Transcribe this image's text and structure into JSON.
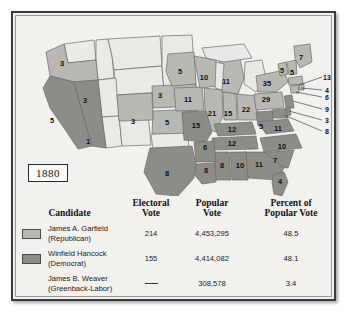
{
  "figure": {
    "year_label": "1880",
    "colors": {
      "republican": "#b9b9b4",
      "democrat": "#8d8d87",
      "territory": "#eceae4",
      "lake": "#e8e9e6",
      "outline": "#6b6b66",
      "frame": "#3a3a3a",
      "background": "#f2f1ee"
    }
  },
  "map": {
    "states": [
      {
        "abbr": "OR",
        "votes": "3",
        "party": "republican",
        "x": 46,
        "y": 48
      },
      {
        "abbr": "NV",
        "votes": "3",
        "party": "democrat",
        "x": 69,
        "y": 85
      },
      {
        "abbr": "CA",
        "votes": "5",
        "party": "democrat",
        "x": 36,
        "y": 105
      },
      {
        "abbr": "CA-1",
        "votes": "1",
        "party": "republican",
        "x": 72,
        "y": 126
      },
      {
        "abbr": "CO",
        "votes": "3",
        "party": "republican",
        "x": 117,
        "y": 106
      },
      {
        "abbr": "NE",
        "votes": "3",
        "party": "republican",
        "x": 144,
        "y": 80
      },
      {
        "abbr": "KS",
        "votes": "5",
        "party": "republican",
        "x": 151,
        "y": 107
      },
      {
        "abbr": "MN",
        "votes": "5",
        "party": "republican",
        "x": 164,
        "y": 56
      },
      {
        "abbr": "IA",
        "votes": "11",
        "party": "republican",
        "x": 172,
        "y": 84
      },
      {
        "abbr": "MO",
        "votes": "15",
        "party": "democrat",
        "x": 180,
        "y": 110
      },
      {
        "abbr": "WI",
        "votes": "10",
        "party": "republican",
        "x": 188,
        "y": 62
      },
      {
        "abbr": "IL",
        "votes": "21",
        "party": "republican",
        "x": 196,
        "y": 98
      },
      {
        "abbr": "MI",
        "votes": "11",
        "party": "republican",
        "x": 210,
        "y": 66
      },
      {
        "abbr": "IN",
        "votes": "15",
        "party": "republican",
        "x": 212,
        "y": 98
      },
      {
        "abbr": "OH",
        "votes": "22",
        "party": "republican",
        "x": 230,
        "y": 94
      },
      {
        "abbr": "KY",
        "votes": "12",
        "party": "democrat",
        "x": 216,
        "y": 114
      },
      {
        "abbr": "TN",
        "votes": "12",
        "party": "democrat",
        "x": 216,
        "y": 128
      },
      {
        "abbr": "WV",
        "votes": "5",
        "party": "democrat",
        "x": 245,
        "y": 111
      },
      {
        "abbr": "VA",
        "votes": "11",
        "party": "democrat",
        "x": 262,
        "y": 113
      },
      {
        "abbr": "NC",
        "votes": "10",
        "party": "democrat",
        "x": 266,
        "y": 131
      },
      {
        "abbr": "SC",
        "votes": "7",
        "party": "democrat",
        "x": 259,
        "y": 145
      },
      {
        "abbr": "GA",
        "votes": "11",
        "party": "democrat",
        "x": 243,
        "y": 149
      },
      {
        "abbr": "AL",
        "votes": "10",
        "party": "democrat",
        "x": 224,
        "y": 150
      },
      {
        "abbr": "MS",
        "votes": "8",
        "party": "democrat",
        "x": 206,
        "y": 150
      },
      {
        "abbr": "AR",
        "votes": "6",
        "party": "democrat",
        "x": 189,
        "y": 132
      },
      {
        "abbr": "LA",
        "votes": "8",
        "party": "democrat",
        "x": 190,
        "y": 155
      },
      {
        "abbr": "TX",
        "votes": "8",
        "party": "democrat",
        "x": 151,
        "y": 158
      },
      {
        "abbr": "FL",
        "votes": "4",
        "party": "democrat",
        "x": 264,
        "y": 166
      },
      {
        "abbr": "PA",
        "votes": "29",
        "party": "republican",
        "x": 250,
        "y": 84
      },
      {
        "abbr": "NY",
        "votes": "35",
        "party": "republican",
        "x": 251,
        "y": 68
      },
      {
        "abbr": "VT",
        "votes": "5",
        "party": "republican",
        "x": 266,
        "y": 55
      },
      {
        "abbr": "NH",
        "votes": "5",
        "party": "republican",
        "x": 276,
        "y": 57
      },
      {
        "abbr": "ME",
        "votes": "7",
        "party": "republican",
        "x": 285,
        "y": 42
      }
    ],
    "callouts": [
      {
        "abbr": "MA",
        "votes": "13",
        "party": "republican",
        "lx": 311,
        "ly": 61,
        "ax": 283,
        "ay": 69
      },
      {
        "abbr": "RI",
        "votes": "4",
        "party": "republican",
        "lx": 311,
        "ly": 74,
        "ax": 283,
        "ay": 73
      },
      {
        "abbr": "CT",
        "votes": "6",
        "party": "republican",
        "lx": 311,
        "ly": 81,
        "ax": 280,
        "ay": 77
      },
      {
        "abbr": "NJ",
        "votes": "9",
        "party": "democrat",
        "lx": 311,
        "ly": 93,
        "ax": 276,
        "ay": 85
      },
      {
        "abbr": "DE",
        "votes": "3",
        "party": "democrat",
        "lx": 311,
        "ly": 104,
        "ax": 272,
        "ay": 93
      },
      {
        "abbr": "MD",
        "votes": "8",
        "party": "democrat",
        "lx": 311,
        "ly": 115,
        "ax": 270,
        "ay": 97
      }
    ]
  },
  "table": {
    "headers": {
      "candidate": "Candidate",
      "electoral_line1": "Electoral",
      "electoral_line2": "Vote",
      "popular_line1": "Popular",
      "popular_line2": "Vote",
      "percent_line1": "Percent of",
      "percent_line2": "Popular Vote"
    },
    "rows": [
      {
        "name": "James A. Garfield",
        "party": "(Republican)",
        "electoral_vote": "214",
        "popular_vote": "4,453,295",
        "percent": "48.5",
        "swatch": "#b9b9b4",
        "has_swatch": true,
        "dash": false
      },
      {
        "name": "Winfield Hancock",
        "party": "(Democrat)",
        "electoral_vote": "155",
        "popular_vote": "4,414,082",
        "percent": "48.1",
        "swatch": "#8d8d87",
        "has_swatch": true,
        "dash": false
      },
      {
        "name": "James B. Weaver",
        "party": "(Greenback-Labor)",
        "electoral_vote": "",
        "popular_vote": "308,578",
        "percent": "3.4",
        "swatch": "",
        "has_swatch": false,
        "dash": true
      }
    ]
  }
}
